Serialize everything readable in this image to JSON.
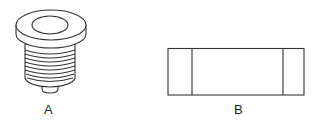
{
  "figures": [
    {
      "id": "A",
      "label": "A",
      "description": "threaded plug with flanged cap"
    },
    {
      "id": "B",
      "label": "B",
      "description": "rectangular part with two end sections"
    }
  ],
  "colors": {
    "line": "#333333",
    "background": "#ffffff"
  }
}
